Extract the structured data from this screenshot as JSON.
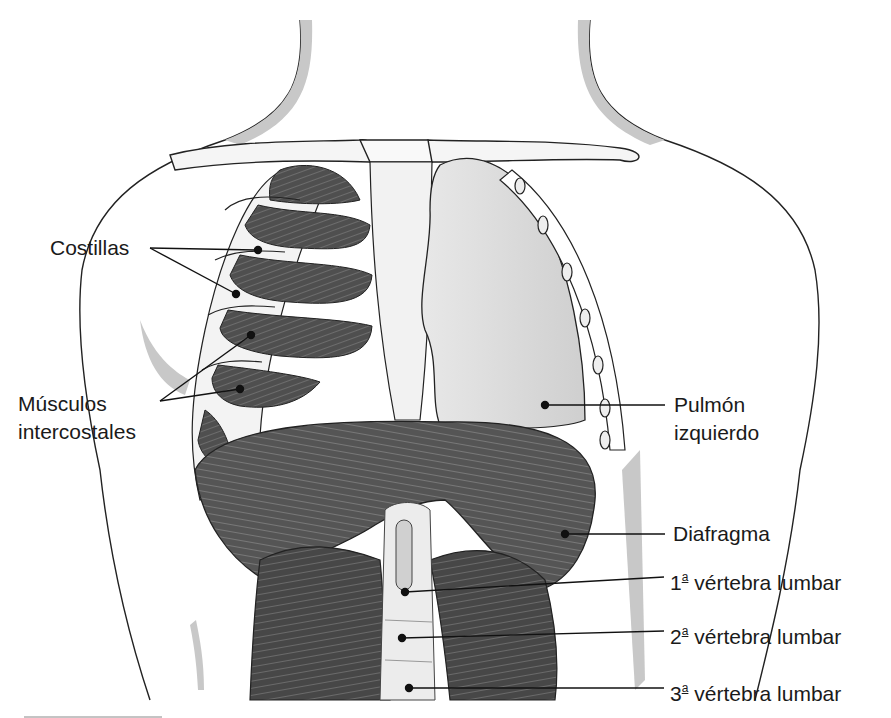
{
  "diagram": {
    "labels": {
      "costillas": "Costillas",
      "musculos_1": "Músculos",
      "musculos_2": "intercostales",
      "pulmon_1": "Pulmón",
      "pulmon_2": "izquierdo",
      "diafragma": "Diafragma",
      "v1_num": "1",
      "v1_sup": "a",
      "v1_text": " vértebra lumbar",
      "v2_num": "2",
      "v2_sup": "a",
      "v2_text": " vértebra lumbar",
      "v3_num": "3",
      "v3_sup": "a",
      "v3_text": " vértebra lumbar"
    },
    "colors": {
      "muscle_dark": "#4a4a4a",
      "muscle_mid": "#6b6b6b",
      "lung_fill": "#dcdcdc",
      "skin_shadow": "#c8c8c8",
      "outline": "#222222",
      "bone": "#f4f4f4"
    }
  }
}
